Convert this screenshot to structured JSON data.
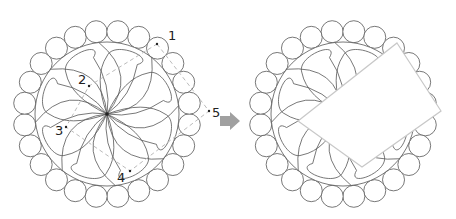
{
  "diagram": {
    "left_design": {
      "center": [
        107,
        114
      ],
      "ring_radius": 83,
      "scallop_count": 24,
      "scallop_radius": 11,
      "inner_circle_radius": 72,
      "petal_count": 8,
      "points": [
        {
          "label": "1",
          "x": 157,
          "y": 44,
          "lx": 168,
          "ly": 40
        },
        {
          "label": "2",
          "x": 89,
          "y": 86,
          "lx": 78,
          "ly": 84
        },
        {
          "label": "3",
          "x": 66,
          "y": 127,
          "lx": 55,
          "ly": 135
        },
        {
          "label": "4",
          "x": 130,
          "y": 171,
          "lx": 117,
          "ly": 182
        },
        {
          "label": "5",
          "x": 209,
          "y": 111,
          "lx": 212,
          "ly": 117
        }
      ]
    },
    "arrow": {
      "x": 220,
      "y": 121,
      "color": "#999999"
    },
    "right_design": {
      "center": [
        343,
        114
      ],
      "rectangle_corners": [
        [
          397,
          43
        ],
        [
          441,
          111
        ],
        [
          362,
          167
        ],
        [
          298,
          121
        ]
      ]
    },
    "colors": {
      "line": "#555555",
      "dashed": "#bbbbbb",
      "arrow": "#a0a0a0",
      "rect_stroke": "#c8c8c8"
    }
  }
}
